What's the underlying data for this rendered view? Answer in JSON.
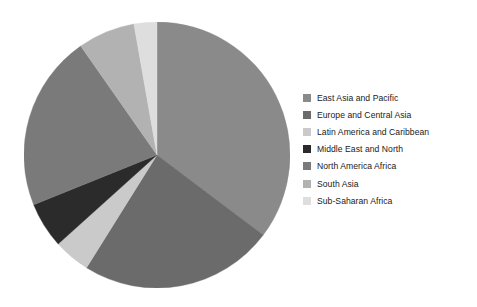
{
  "chart_data": {
    "type": "pie",
    "title": "",
    "subtitle": "",
    "xlabel": "",
    "ylabel": "",
    "grid": false,
    "legend_position": "right",
    "start_angle_deg": 0,
    "direction": "clockwise",
    "categories": [
      "East Asia and Pacific",
      "Europe and Central Asia",
      "Latin America and Caribbean",
      "Middle East and North",
      "North America Africa",
      "South Asia",
      "Sub-Saharan Africa"
    ],
    "values": [
      35.3,
      23.6,
      4.4,
      5.6,
      21.4,
      6.9,
      2.8
    ],
    "colors": [
      "#8a8a8a",
      "#6b6b6b",
      "#cacaca",
      "#2b2b2b",
      "#7a7a7a",
      "#b2b2b2",
      "#dedede"
    ],
    "slices": [
      {
        "label": "East Asia and Pacific",
        "value": 35.3,
        "color": "#8a8a8a",
        "start_deg": 0,
        "end_deg": 127
      },
      {
        "label": "Europe and Central Asia",
        "value": 23.6,
        "color": "#6b6b6b",
        "start_deg": 127,
        "end_deg": 212
      },
      {
        "label": "Latin America and Caribbean",
        "value": 4.4,
        "color": "#cacaca",
        "start_deg": 212,
        "end_deg": 228
      },
      {
        "label": "Middle East and North",
        "value": 5.6,
        "color": "#2b2b2b",
        "start_deg": 228,
        "end_deg": 248
      },
      {
        "label": "North America Africa",
        "value": 21.4,
        "color": "#7a7a7a",
        "start_deg": 248,
        "end_deg": 325
      },
      {
        "label": "South Asia",
        "value": 6.9,
        "color": "#b2b2b2",
        "start_deg": 325,
        "end_deg": 350
      },
      {
        "label": "Sub-Saharan Africa",
        "value": 2.8,
        "color": "#dedede",
        "start_deg": 350,
        "end_deg": 360
      }
    ]
  },
  "legend": {
    "items": [
      {
        "label": "East Asia and Pacific",
        "color": "#8a8a8a"
      },
      {
        "label": "Europe and Central Asia",
        "color": "#6b6b6b"
      },
      {
        "label": "Latin America and Caribbean",
        "color": "#cacaca"
      },
      {
        "label": "Middle East and North",
        "color": "#2b2b2b"
      },
      {
        "label": "North America Africa",
        "color": "#7a7a7a"
      },
      {
        "label": "South Asia",
        "color": "#b2b2b2"
      },
      {
        "label": "Sub-Saharan Africa",
        "color": "#dedede"
      }
    ]
  }
}
